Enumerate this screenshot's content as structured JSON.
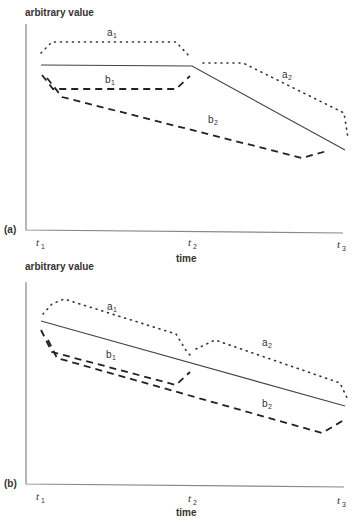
{
  "panels": [
    {
      "id": "a",
      "panel_label": "(a)",
      "y_axis_label": "arbitrary value",
      "x_axis_label": "time",
      "ticks": [
        {
          "base": "t",
          "sub": "1"
        },
        {
          "base": "t",
          "sub": "2"
        },
        {
          "base": "t",
          "sub": "3"
        }
      ],
      "curves": {
        "a1": {
          "base": "a",
          "sub": "1"
        },
        "a2": {
          "base": "a",
          "sub": "2"
        },
        "b1": {
          "base": "b",
          "sub": "1"
        },
        "b2": {
          "base": "b",
          "sub": "2"
        }
      }
    },
    {
      "id": "b",
      "panel_label": "(b)",
      "y_axis_label": "arbitrary value",
      "x_axis_label": "time",
      "ticks": [
        {
          "base": "t",
          "sub": "1"
        },
        {
          "base": "t",
          "sub": "2"
        },
        {
          "base": "t",
          "sub": "3"
        }
      ],
      "curves": {
        "a1": {
          "base": "a",
          "sub": "1"
        },
        "a2": {
          "base": "a",
          "sub": "2"
        },
        "b1": {
          "base": "b",
          "sub": "1"
        },
        "b2": {
          "base": "b",
          "sub": "2"
        }
      }
    }
  ],
  "legend_styles": {
    "solid": "reference trend",
    "dotted": "a curves",
    "dashed": "b curves"
  }
}
